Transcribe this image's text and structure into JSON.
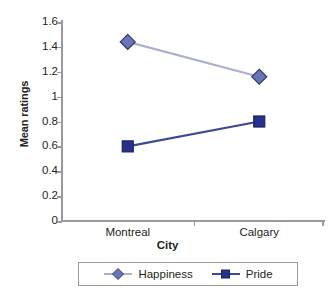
{
  "chart_data": {
    "type": "line",
    "title": "",
    "xlabel": "City",
    "ylabel": "Mean ratings",
    "categories": [
      "Montreal",
      "Calgary"
    ],
    "ylim": [
      0,
      1.6
    ],
    "y_ticks": [
      0,
      0.2,
      0.4,
      0.6,
      0.8,
      1,
      1.2,
      1.4,
      1.6
    ],
    "y_tick_labels": [
      "0",
      "0.2",
      "0.4",
      "0.6",
      "0.8",
      "1",
      "1.2",
      "1.4",
      "1.6"
    ],
    "grid": false,
    "legend_position": "bottom",
    "series": [
      {
        "name": "Happiness",
        "values": [
          1.44,
          1.16
        ],
        "marker": "diamond",
        "marker_fill": "#6b74b4",
        "marker_stroke": "#2e3a77",
        "line_color": "#aab0cf"
      },
      {
        "name": "Pride",
        "values": [
          0.6,
          0.8
        ],
        "marker": "square",
        "marker_fill": "#27318a",
        "marker_stroke": "#1b2266",
        "line_color": "#3d4a94"
      }
    ]
  },
  "axes": {
    "y_title": "Mean ratings",
    "x_title": "City",
    "axis_color": "#9a9a9a"
  },
  "legend": {
    "entries": [
      {
        "label": "Happiness"
      },
      {
        "label": "Pride"
      }
    ]
  }
}
